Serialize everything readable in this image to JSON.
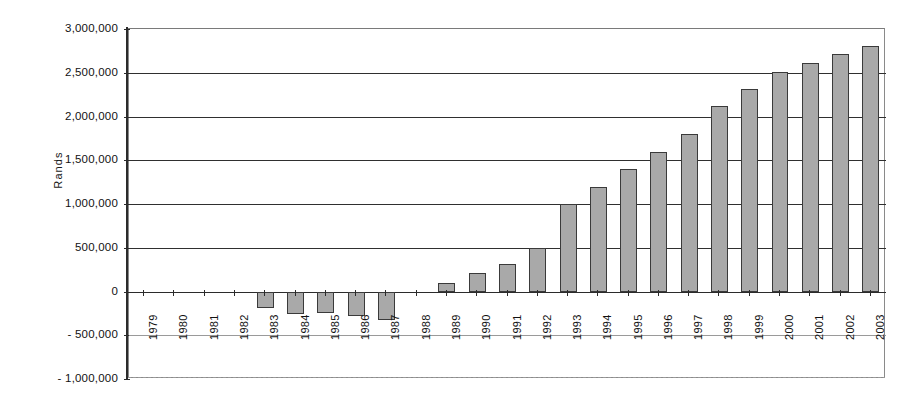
{
  "chart_data": {
    "type": "bar",
    "title": "",
    "subtitle": "",
    "xlabel": "",
    "ylabel": "Rands",
    "ylim": [
      -1000000,
      3000000
    ],
    "ytick_step": 500000,
    "grid": true,
    "legend": "none",
    "orientation": "vertical",
    "bar_color": "#a9a9a9",
    "bar_edge_color": "#3a3a3a",
    "categories": [
      "1979",
      "1980",
      "1981",
      "1982",
      "1983",
      "1984",
      "1985",
      "1986",
      "1987",
      "1988",
      "1989",
      "1990",
      "1991",
      "1992",
      "1993",
      "1994",
      "1995",
      "1996",
      "1997",
      "1998",
      "1999",
      "2000",
      "2001",
      "2002",
      "2003"
    ],
    "values": [
      0,
      0,
      0,
      0,
      -190000,
      -260000,
      -250000,
      -280000,
      -330000,
      0,
      100000,
      210000,
      310000,
      500000,
      1000000,
      1200000,
      1400000,
      1600000,
      1800000,
      2120000,
      2320000,
      2510000,
      2610000,
      2720000,
      2810000
    ],
    "ytick_labels": [
      "3,000,000",
      "2,500,000",
      "2,000,000",
      "1,500,000",
      "1,000,000",
      "500,000",
      "0",
      "- 500,000",
      "- 1,000,000"
    ],
    "ytick_values": [
      3000000,
      2500000,
      2000000,
      1500000,
      1000000,
      500000,
      0,
      -500000,
      -1000000
    ],
    "series": [
      {
        "name": "Rands",
        "values": [
          0,
          0,
          0,
          0,
          -190000,
          -260000,
          -250000,
          -280000,
          -330000,
          0,
          100000,
          210000,
          310000,
          500000,
          1000000,
          1200000,
          1400000,
          1600000,
          1800000,
          2120000,
          2320000,
          2510000,
          2610000,
          2720000,
          2810000
        ]
      }
    ]
  },
  "axis": {
    "y_title": "Rands"
  }
}
